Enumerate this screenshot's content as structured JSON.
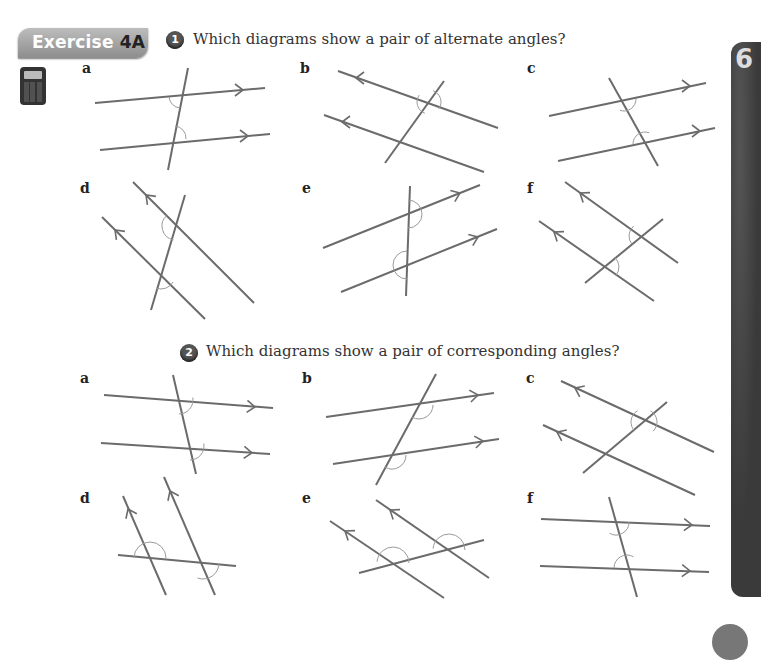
{
  "header": {
    "exercise_word": "Exercise",
    "exercise_num": "4A",
    "calculator_icon": "calculator-icon"
  },
  "chapter_tab": {
    "label": "6"
  },
  "questions": [
    {
      "number": "1",
      "text": "Which diagrams show a pair of alternate angles?",
      "diagrams": [
        {
          "label": "a",
          "lx": 82,
          "ly": 60,
          "lines": [
            [
              95,
              103,
              265,
              88
            ],
            [
              100,
              150,
              270,
              134
            ],
            [
              188,
              68,
              168,
              170
            ]
          ],
          "arrows": [
            [
              243,
              90,
              0
            ],
            [
              248,
              136,
              0
            ]
          ],
          "arcs": [
            [
              181,
              96,
              12,
              95,
              175
            ],
            [
              174,
              138,
              12,
              -85,
              5
            ]
          ]
        },
        {
          "label": "b",
          "lx": 300,
          "ly": 60,
          "lines": [
            [
              338,
              71,
              498,
              128
            ],
            [
              324,
              115,
              484,
              172
            ],
            [
              444,
              81,
              385,
              163
            ]
          ],
          "arrows": [
            [
              356,
              78,
              180
            ],
            [
              342,
              122,
              180
            ]
          ],
          "arcs": [
            [
              429,
              102,
              12,
              -70,
              35
            ],
            [
              429,
              102,
              12,
              110,
              215
            ]
          ]
        },
        {
          "label": "c",
          "lx": 527,
          "ly": 60,
          "lines": [
            [
              549,
              116,
              706,
              83
            ],
            [
              558,
              161,
              715,
              128
            ],
            [
              609,
              78,
              658,
              166
            ]
          ],
          "arrows": [
            [
              690,
              86,
              0
            ],
            [
              700,
              131,
              0
            ]
          ],
          "arcs": [
            [
              624,
              99,
              12,
              0,
              110
            ],
            [
              645,
              144,
              12,
              180,
              290
            ]
          ]
        },
        {
          "label": "d",
          "lx": 80,
          "ly": 180,
          "lines": [
            [
              133,
              182,
              254,
              303
            ],
            [
              102,
              217,
              205,
              319
            ],
            [
              185,
              195,
              151,
              310
            ]
          ],
          "arrows": [
            [
              146,
              195,
              225
            ],
            [
              115,
              230,
              225
            ]
          ],
          "arcs": [
            [
              176,
              226,
              14,
              100,
              230
            ],
            [
              161,
              275,
              14,
              30,
              110
            ]
          ]
        },
        {
          "label": "e",
          "lx": 302,
          "ly": 180,
          "lines": [
            [
              323,
              248,
              480,
              185
            ],
            [
              341,
              292,
              497,
              229
            ],
            [
              410,
              186,
              406,
              296
            ]
          ],
          "arrows": [
            [
              460,
              193,
              -22
            ],
            [
              478,
              237,
              -22
            ]
          ],
          "arcs": [
            [
              408,
              214,
              14,
              -90,
              90
            ],
            [
              407,
              265,
              14,
              90,
              270
            ]
          ]
        },
        {
          "label": "f",
          "lx": 527,
          "ly": 180,
          "lines": [
            [
              565,
              182,
              678,
              263
            ],
            [
              539,
              221,
              654,
              301
            ],
            [
              585,
              283,
              663,
              219
            ]
          ],
          "arrows": [
            [
              580,
              193,
              215
            ],
            [
              554,
              232,
              215
            ]
          ],
          "arcs": [
            [
              642,
              236,
              13,
              140,
              230
            ],
            [
              606,
              267,
              13,
              -50,
              40
            ]
          ]
        }
      ]
    },
    {
      "number": "2",
      "text": "Which diagrams show a pair of corresponding angles?",
      "diagrams": [
        {
          "label": "a",
          "lx": 80,
          "ly": 370,
          "lines": [
            [
              104,
              395,
              273,
              408
            ],
            [
              101,
              443,
              270,
              454
            ],
            [
              173,
              375,
              196,
              474
            ]
          ],
          "arrows": [
            [
              255,
              407,
              4
            ],
            [
              252,
              453,
              4
            ]
          ],
          "arcs": [
            [
              179,
              400,
              14,
              -10,
              90
            ],
            [
              190,
              446,
              14,
              -10,
              90
            ]
          ]
        },
        {
          "label": "b",
          "lx": 302,
          "ly": 370,
          "lines": [
            [
              326,
              417,
              494,
              393
            ],
            [
              333,
              464,
              499,
              439
            ],
            [
              436,
              374,
              376,
              485
            ]
          ],
          "arrows": [
            [
              478,
              395,
              -8
            ],
            [
              483,
              441,
              -8
            ]
          ],
          "arcs": [
            [
              419,
              405,
              14,
              0,
              120
            ],
            [
              392,
              455,
              14,
              0,
              120
            ]
          ]
        },
        {
          "label": "c",
          "lx": 526,
          "ly": 370,
          "lines": [
            [
              561,
              381,
              714,
              452
            ],
            [
              543,
              425,
              695,
              495
            ],
            [
              583,
              473,
              667,
              402
            ]
          ],
          "arrows": [
            [
              575,
              388,
              205
            ],
            [
              557,
              432,
              205
            ]
          ],
          "arcs": [
            [
              644,
              422,
              13,
              -60,
              45
            ],
            [
              644,
              422,
              13,
              135,
              240
            ]
          ]
        },
        {
          "label": "d",
          "lx": 80,
          "ly": 490,
          "lines": [
            [
              123,
              496,
              166,
              595
            ],
            [
              164,
              477,
              215,
              595
            ],
            [
              118,
              555,
              236,
              566
            ]
          ],
          "arrows": [
            [
              128,
              509,
              245
            ],
            [
              170,
              491,
              245
            ]
          ],
          "arcs": [
            [
              150,
              558,
              16,
              180,
              360
            ],
            [
              203,
              563,
              16,
              0,
              110
            ]
          ]
        },
        {
          "label": "e",
          "lx": 302,
          "ly": 490,
          "lines": [
            [
              330,
              521,
              444,
              598
            ],
            [
              376,
              500,
              489,
              578
            ],
            [
              359,
              573,
              484,
              540
            ]
          ],
          "arrows": [
            [
              345,
              531,
              215
            ],
            [
              390,
              510,
              215
            ]
          ],
          "arcs": [
            [
              393,
              563,
              16,
              185,
              360
            ],
            [
              449,
              550,
              16,
              185,
              360
            ]
          ]
        },
        {
          "label": "f",
          "lx": 527,
          "ly": 490,
          "lines": [
            [
              541,
              519,
              710,
              526
            ],
            [
              540,
              566,
              709,
              572
            ],
            [
              609,
              497,
              637,
              597
            ]
          ],
          "arrows": [
            [
              692,
              525,
              2
            ],
            [
              690,
              571,
              2
            ]
          ],
          "arcs": [
            [
              616,
              522,
              13,
              0,
              120
            ],
            [
              627,
              568,
              13,
              180,
              300
            ]
          ]
        }
      ]
    }
  ],
  "colors": {
    "line": "#6b6b6b",
    "arc": "#9a9a9a",
    "text": "#333333"
  }
}
